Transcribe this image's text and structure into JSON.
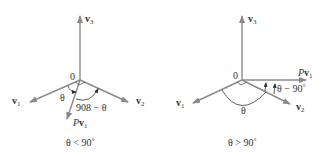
{
  "colors": {
    "axis": "#8a8a8a",
    "text": "#333333",
    "background": "#ffffff"
  },
  "left_panel": {
    "origin_label": "0",
    "v3_label": "v",
    "v3_sub": "3",
    "v1_label": "v",
    "v1_sub": "1",
    "v2_label": "v",
    "v2_sub": "2",
    "pv1_prefix": "P",
    "pv1_label": "v",
    "pv1_sub": "1",
    "theta_label": "θ",
    "complement_label": "908 − θ",
    "caption": "θ < 90˚"
  },
  "right_panel": {
    "origin_label": "0",
    "v3_label": "v",
    "v3_sub": "3",
    "v1_label": "v",
    "v1_sub": "1",
    "v2_label": "v",
    "v2_sub": "2",
    "pv1_prefix": "P",
    "pv1_label": "v",
    "pv1_sub": "1",
    "theta_label": "θ",
    "angle_label": "θ − 90˚",
    "caption": "θ > 90˚"
  }
}
